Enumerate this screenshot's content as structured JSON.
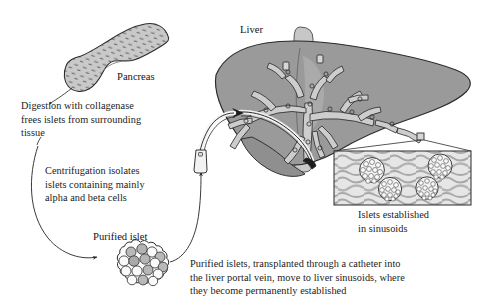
{
  "figure": {
    "title_caption": "Islet transplantation from pancreas to liver",
    "background_color": "#ffffff",
    "ink_color": "#1b1b1b",
    "organ_fill": "#9a9a9a",
    "vessel_fill": "#cfcfcf",
    "inset_fill": "#e2e2e2",
    "islet_cell_fill": "#bdbdbd"
  },
  "labels": {
    "pancreas": "Pancreas",
    "liver": "Liver",
    "purified_islet": "Purified islet"
  },
  "steps": {
    "digestion": "Digestion with collagenase\nfrees islets from surrounding\ntissue",
    "centrifugation": "Centrifugation isolates\nislets containing mainly\nalpha and beta cells",
    "transplant": "Purified islets, transplanted through a catheter into\nthe liver portal vein, move to liver sinusoids, where\nthey become permanently established"
  },
  "inset": {
    "caption": "Islets established\nin sinusoids",
    "islet_count": 4
  },
  "icons": {
    "pancreas": "pancreas-organ-icon",
    "liver": "liver-organ-icon",
    "catheter": "catheter-icon",
    "islet": "islet-cluster-icon",
    "arrow": "curved-arrow-icon"
  }
}
